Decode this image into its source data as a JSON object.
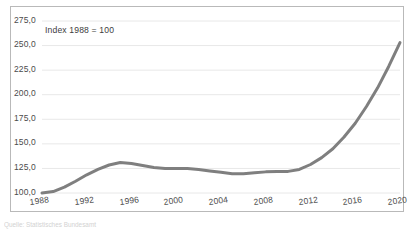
{
  "chart_data": {
    "type": "line",
    "title": "",
    "subtitle": "",
    "annotation": "Index 1988 = 100",
    "xlabel": "",
    "ylabel": "",
    "grid": true,
    "legend": false,
    "legend_position": "none",
    "line_color": "#7f7f7f",
    "xlim": [
      1988,
      2020
    ],
    "ylim": [
      100,
      275
    ],
    "x_tick_labels": [
      "1988",
      "1992",
      "1996",
      "2000",
      "2004",
      "2008",
      "2012",
      "2016",
      "2020"
    ],
    "x_ticks": [
      1988,
      1992,
      1996,
      2000,
      2004,
      2008,
      2012,
      2016,
      2020
    ],
    "y_tick_labels": [
      "100,0",
      "125,0",
      "150,0",
      "175,0",
      "200,0",
      "225,0",
      "250,0",
      "275,0"
    ],
    "y_ticks": [
      100,
      125,
      150,
      175,
      200,
      225,
      250,
      275
    ],
    "series": [
      {
        "name": "Index",
        "x": [
          1988,
          1989,
          1990,
          1991,
          1992,
          1993,
          1994,
          1995,
          1996,
          1997,
          1998,
          1999,
          2000,
          2001,
          2002,
          2003,
          2004,
          2005,
          2006,
          2007,
          2008,
          2009,
          2010,
          2011,
          2012,
          2013,
          2014,
          2015,
          2016,
          2017,
          2018,
          2019,
          2020
        ],
        "values": [
          100.0,
          101.5,
          106.0,
          112.0,
          118.5,
          124.0,
          128.5,
          131.0,
          130.0,
          128.0,
          126.0,
          125.0,
          125.0,
          125.0,
          124.0,
          122.5,
          121.0,
          119.5,
          119.5,
          120.5,
          121.5,
          122.0,
          122.0,
          124.0,
          129.0,
          136.0,
          145.0,
          157.0,
          171.0,
          188.0,
          207.0,
          229.0,
          253.0
        ]
      }
    ]
  },
  "source": {
    "text": "Quelle: Statistisches Bundesamt"
  }
}
